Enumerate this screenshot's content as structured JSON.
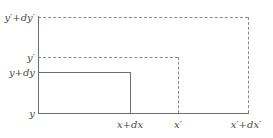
{
  "figure": {
    "background_color": "#ffffff",
    "solid_line_color": "#6e6e6e",
    "dashed_line_color": "#8a8a8a",
    "label_color": "#4a4a4a"
  },
  "y_axis": {
    "labels": [
      {
        "id": "y-prime-plus-dy-prime",
        "text": "y′+dy′",
        "y": 17
      },
      {
        "id": "y-prime",
        "text": "y′",
        "y": 57
      },
      {
        "id": "y-plus-dy",
        "text": "y+dy",
        "y": 72
      },
      {
        "id": "y",
        "text": "y",
        "y": 113
      }
    ]
  },
  "x_axis": {
    "labels": [
      {
        "id": "x-plus-dx",
        "text": "x+dx",
        "x": 130
      },
      {
        "id": "x-prime",
        "text": "x′",
        "x": 178
      },
      {
        "id": "x-prime-plus-dx-prime",
        "text": "x′+dx′",
        "x": 248
      }
    ]
  },
  "geometry": {
    "axis_left_x": 38,
    "axis_bottom_y": 113,
    "inner_rect_right_x": 130,
    "inner_rect_top_y": 72,
    "mid_rect_right_x": 178,
    "mid_rect_top_y": 57,
    "outer_rect_right_x": 248,
    "outer_rect_top_y": 17
  },
  "shapes": {
    "outer_dashed_rect": "y′+dy′ by x′+dx′ region (dashed)",
    "mid_dashed_rect": "y′ by x′ region (dashed)",
    "inner_solid_rect": "y+dy by x+dx region (solid)"
  }
}
